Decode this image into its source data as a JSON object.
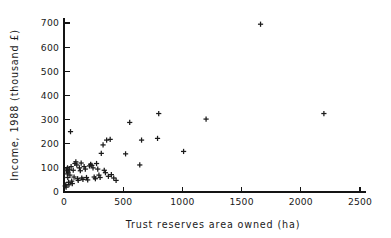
{
  "chart_data": {
    "type": "scatter",
    "title": "",
    "xlabel": "Trust reserves area owned (ha)",
    "ylabel": "Income, 1988 (thousand £)",
    "xlim": [
      0,
      2500
    ],
    "ylim": [
      0,
      700
    ],
    "xticks": [
      0,
      500,
      1000,
      1500,
      2000,
      2500
    ],
    "yticks": [
      0,
      100,
      200,
      300,
      400,
      500,
      600,
      700
    ],
    "xtick_labels": [
      "0",
      "500",
      "1000",
      "1500",
      "2000",
      "2500"
    ],
    "ytick_labels": [
      "0",
      "100",
      "200",
      "300",
      "400",
      "500",
      "600",
      "700"
    ],
    "grid": false,
    "legend": false,
    "marker": "plus",
    "marker_color": "#1b1b1b",
    "series": [
      {
        "name": "Wildlife trusts",
        "points": [
          [
            10,
            25
          ],
          [
            15,
            30
          ],
          [
            18,
            20
          ],
          [
            22,
            88
          ],
          [
            25,
            95
          ],
          [
            28,
            75
          ],
          [
            30,
            100
          ],
          [
            32,
            60
          ],
          [
            35,
            82
          ],
          [
            38,
            40
          ],
          [
            42,
            30
          ],
          [
            45,
            92
          ],
          [
            50,
            70
          ],
          [
            55,
            250
          ],
          [
            60,
            105
          ],
          [
            65,
            45
          ],
          [
            70,
            35
          ],
          [
            78,
            90
          ],
          [
            85,
            62
          ],
          [
            92,
            118
          ],
          [
            100,
            125
          ],
          [
            108,
            112
          ],
          [
            115,
            55
          ],
          [
            120,
            48
          ],
          [
            130,
            100
          ],
          [
            138,
            88
          ],
          [
            145,
            120
          ],
          [
            150,
            58
          ],
          [
            160,
            52
          ],
          [
            170,
            105
          ],
          [
            180,
            95
          ],
          [
            190,
            60
          ],
          [
            200,
            50
          ],
          [
            215,
            108
          ],
          [
            225,
            115
          ],
          [
            235,
            110
          ],
          [
            245,
            100
          ],
          [
            255,
            62
          ],
          [
            265,
            55
          ],
          [
            275,
            118
          ],
          [
            285,
            95
          ],
          [
            295,
            70
          ],
          [
            305,
            60
          ],
          [
            315,
            160
          ],
          [
            330,
            195
          ],
          [
            340,
            90
          ],
          [
            350,
            80
          ],
          [
            360,
            215
          ],
          [
            375,
            65
          ],
          [
            390,
            218
          ],
          [
            400,
            72
          ],
          [
            420,
            58
          ],
          [
            440,
            48
          ],
          [
            520,
            158
          ],
          [
            555,
            288
          ],
          [
            640,
            112
          ],
          [
            655,
            215
          ],
          [
            790,
            222
          ],
          [
            800,
            325
          ],
          [
            1010,
            168
          ],
          [
            1200,
            302
          ],
          [
            1660,
            695
          ],
          [
            2195,
            325
          ]
        ]
      }
    ]
  },
  "axes": {
    "x_axis_name": "x-axis",
    "y_axis_name": "y-axis"
  }
}
